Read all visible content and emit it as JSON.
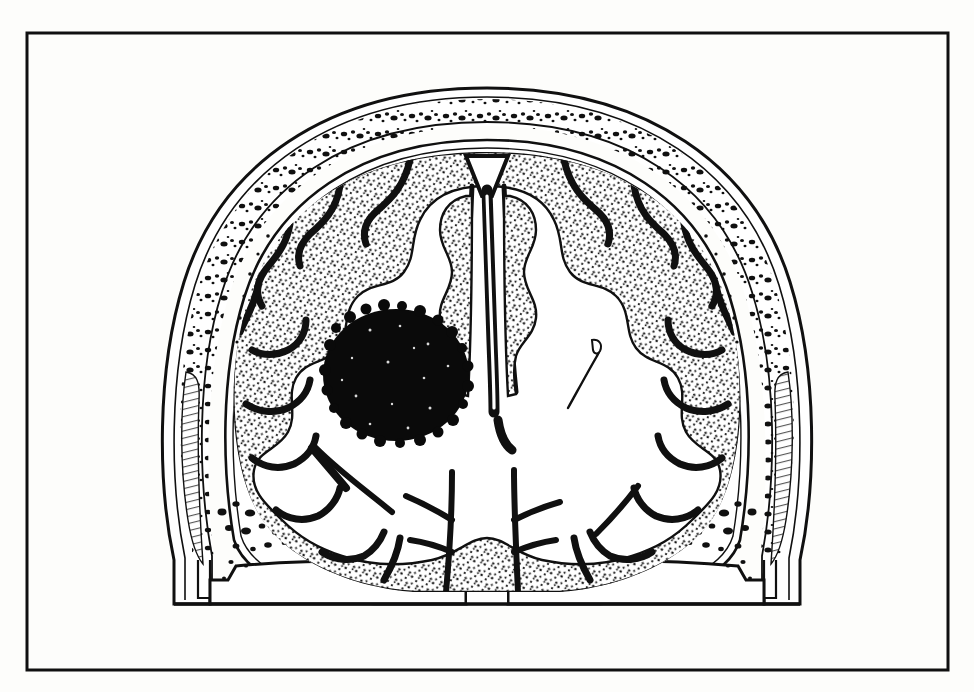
{
  "figure": {
    "kind": "line-art-medical-illustration",
    "title": "",
    "caption": "",
    "background_color": "#fdfdfb",
    "ink_color": "#101010",
    "frame": {
      "name": "illustration-border",
      "x": 27,
      "y": 33,
      "width": 921,
      "height": 637,
      "stroke_width": 3,
      "stroke_color": "#101010",
      "fill": "none"
    },
    "canvas": {
      "width": 974,
      "height": 692
    }
  },
  "anatomy": {
    "midline_x": 487,
    "structures": [
      {
        "id": "scalp",
        "label": "Scalp / outer soft tissue",
        "stroke": "#101010"
      },
      {
        "id": "skull-outer-table",
        "label": "Skull outer table",
        "stroke": "#101010"
      },
      {
        "id": "diploe",
        "label": "Diploe (stippled marrow spaces)",
        "stroke": "#101010"
      },
      {
        "id": "skull-inner-table",
        "label": "Skull inner table",
        "stroke": "#101010"
      },
      {
        "id": "dura-subarachnoid",
        "label": "Dura and subarachnoid space",
        "stroke": "#101010"
      },
      {
        "id": "cortex-ribbon",
        "label": "Cerebral cortex (grey matter ribbon, stippled)",
        "fill": "stipple"
      },
      {
        "id": "white-matter",
        "label": "Cerebral white matter",
        "fill": "#ffffff"
      },
      {
        "id": "falx-cerebri",
        "label": "Falx cerebri / interhemispheric fissure",
        "stroke": "#101010"
      },
      {
        "id": "superior-sagittal-sinus",
        "label": "Superior sagittal sinus",
        "stroke": "#101010"
      },
      {
        "id": "lateral-ventricle",
        "label": "Right lateral ventricle (slit-like)",
        "stroke": "#101010"
      },
      {
        "id": "temporalis-muscle-left",
        "label": "Temporalis muscle, left",
        "stroke": "#101010"
      },
      {
        "id": "temporalis-muscle-right",
        "label": "Temporalis muscle, right",
        "stroke": "#101010"
      },
      {
        "id": "skull-base",
        "label": "Skull base / petrous ridge",
        "stroke": "#101010"
      },
      {
        "id": "mass-lesion",
        "label": "Round dark intracerebral mass lesion",
        "fill": "#0a0a0a"
      }
    ]
  },
  "lesion": {
    "name": "mass-lesion",
    "center_x": 396,
    "center_y": 375,
    "radius_x": 73,
    "radius_y": 66,
    "fill_color": "#0a0a0a",
    "side": "left-hemisphere-of-image",
    "description": "solid homogeneous black round mass in the white matter"
  },
  "skull": {
    "vertex_y": 90,
    "base_y": 604,
    "left_x": 168,
    "right_x": 800,
    "layers": [
      {
        "name": "outer-scalp-contour",
        "offset": 0
      },
      {
        "name": "skull-outer-table",
        "offset": 10
      },
      {
        "name": "diploe-band",
        "offset": 22
      },
      {
        "name": "skull-inner-table",
        "offset": 40
      },
      {
        "name": "dura-line",
        "offset": 50
      }
    ]
  },
  "view": {
    "plane": "coronal",
    "orientation": "anterior-view",
    "stipple_density": "medium"
  }
}
